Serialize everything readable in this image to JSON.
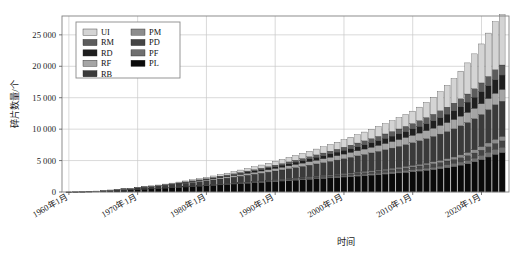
{
  "chart_data": {
    "type": "bar",
    "stacked": true,
    "title": "",
    "xlabel": "时间",
    "ylabel": "碎片数量/个",
    "ylim": [
      0,
      28000
    ],
    "yticks": [
      0,
      5000,
      10000,
      15000,
      20000,
      25000
    ],
    "ytick_labels": [
      "0",
      "5 000",
      "10 000",
      "15 000",
      "20 000",
      "25 000"
    ],
    "grid": true,
    "legend_position": "upper-left",
    "xtick_labels": [
      "1960年1月",
      "1970年1月",
      "1980年1月",
      "1990年1月",
      "2000年1月",
      "2010年1月",
      "2020年1月"
    ],
    "xtick_values": [
      1960,
      1970,
      1980,
      1990,
      2000,
      2010,
      2020
    ],
    "xlim": [
      1959,
      2024
    ],
    "categories": [
      1960,
      1961,
      1962,
      1963,
      1964,
      1965,
      1966,
      1967,
      1968,
      1969,
      1970,
      1971,
      1972,
      1973,
      1974,
      1975,
      1976,
      1977,
      1978,
      1979,
      1980,
      1981,
      1982,
      1983,
      1984,
      1985,
      1986,
      1987,
      1988,
      1989,
      1990,
      1991,
      1992,
      1993,
      1994,
      1995,
      1996,
      1997,
      1998,
      1999,
      2000,
      2001,
      2002,
      2003,
      2004,
      2005,
      2006,
      2007,
      2008,
      2009,
      2010,
      2011,
      2012,
      2013,
      2014,
      2015,
      2016,
      2017,
      2018,
      2019,
      2020,
      2021,
      2022,
      2023
    ],
    "series": [
      {
        "name": "PL",
        "color": "#0a0a0a",
        "values": [
          5,
          18,
          35,
          60,
          95,
          150,
          210,
          265,
          320,
          375,
          430,
          490,
          545,
          600,
          660,
          715,
          770,
          830,
          890,
          950,
          1010,
          1075,
          1140,
          1205,
          1270,
          1335,
          1400,
          1465,
          1530,
          1600,
          1670,
          1740,
          1810,
          1880,
          1950,
          2020,
          2090,
          2160,
          2230,
          2300,
          2375,
          2450,
          2525,
          2600,
          2680,
          2760,
          2845,
          2930,
          3020,
          3110,
          3210,
          3320,
          3440,
          3570,
          3710,
          3870,
          4050,
          4260,
          4500,
          4790,
          5140,
          5560,
          5980,
          6280
        ]
      },
      {
        "name": "PF",
        "color": "#6f6f6f",
        "values": [
          0,
          0,
          0,
          0,
          0,
          0,
          2,
          4,
          6,
          8,
          10,
          12,
          15,
          18,
          20,
          24,
          28,
          32,
          36,
          40,
          45,
          50,
          55,
          60,
          66,
          72,
          78,
          84,
          90,
          96,
          102,
          108,
          115,
          122,
          130,
          138,
          146,
          154,
          162,
          170,
          180,
          190,
          200,
          212,
          224,
          238,
          252,
          268,
          284,
          302,
          322,
          344,
          368,
          394,
          422,
          452,
          486,
          524,
          566,
          612,
          664,
          720,
          778,
          820
        ]
      },
      {
        "name": "PD",
        "color": "#454545",
        "values": [
          0,
          0,
          0,
          0,
          0,
          0,
          0,
          0,
          0,
          0,
          2,
          4,
          6,
          9,
          12,
          15,
          19,
          23,
          28,
          33,
          38,
          44,
          50,
          57,
          64,
          72,
          80,
          89,
          98,
          108,
          118,
          129,
          140,
          152,
          164,
          177,
          190,
          204,
          218,
          233,
          248,
          264,
          280,
          298,
          316,
          336,
          356,
          378,
          400,
          424,
          450,
          478,
          508,
          540,
          574,
          610,
          650,
          694,
          742,
          794,
          850,
          912,
          976,
          1030
        ]
      },
      {
        "name": "PM",
        "color": "#8c8c8c",
        "values": [
          0,
          0,
          0,
          0,
          0,
          0,
          0,
          0,
          0,
          0,
          0,
          0,
          0,
          0,
          0,
          0,
          0,
          0,
          0,
          0,
          2,
          4,
          6,
          8,
          11,
          14,
          17,
          21,
          25,
          29,
          34,
          39,
          44,
          50,
          56,
          63,
          70,
          78,
          86,
          95,
          104,
          114,
          124,
          135,
          147,
          160,
          174,
          189,
          205,
          222,
          240,
          260,
          282,
          306,
          332,
          360,
          392,
          428,
          468,
          512,
          562,
          616,
          672,
          712
        ]
      },
      {
        "name": "RB",
        "color": "#3a3a3a",
        "values": [
          2,
          8,
          18,
          30,
          48,
          70,
          95,
          120,
          150,
          180,
          215,
          250,
          290,
          330,
          375,
          420,
          470,
          520,
          575,
          630,
          690,
          750,
          815,
          880,
          950,
          1020,
          1095,
          1170,
          1250,
          1330,
          1415,
          1500,
          1590,
          1680,
          1775,
          1870,
          1970,
          2070,
          2175,
          2280,
          2390,
          2500,
          2615,
          2730,
          2850,
          2970,
          3095,
          3220,
          3350,
          3480,
          3615,
          3750,
          3890,
          4030,
          4175,
          4320,
          4470,
          4625,
          4785,
          4950,
          5120,
          5295,
          5475,
          5600
        ]
      },
      {
        "name": "RF",
        "color": "#a5a5a5",
        "values": [
          0,
          0,
          0,
          0,
          2,
          5,
          9,
          14,
          20,
          27,
          35,
          44,
          54,
          65,
          77,
          90,
          104,
          119,
          135,
          152,
          170,
          189,
          209,
          230,
          252,
          275,
          299,
          324,
          350,
          377,
          405,
          434,
          464,
          495,
          527,
          560,
          594,
          629,
          665,
          702,
          740,
          779,
          819,
          860,
          902,
          945,
          989,
          1034,
          1080,
          1127,
          1175,
          1224,
          1274,
          1325,
          1377,
          1430,
          1484,
          1539,
          1595,
          1652,
          1710,
          1769,
          1829,
          1870
        ]
      },
      {
        "name": "RD",
        "color": "#1f1f1f",
        "values": [
          0,
          0,
          0,
          0,
          0,
          0,
          0,
          0,
          2,
          5,
          9,
          14,
          20,
          27,
          35,
          44,
          54,
          65,
          77,
          90,
          104,
          119,
          135,
          152,
          170,
          189,
          209,
          230,
          252,
          275,
          299,
          324,
          350,
          377,
          405,
          434,
          464,
          495,
          527,
          560,
          594,
          629,
          665,
          702,
          740,
          780,
          822,
          866,
          912,
          960,
          1010,
          1065,
          1125,
          1190,
          1260,
          1340,
          1430,
          1530,
          1640,
          1760,
          1890,
          2030,
          2180,
          2290
        ]
      },
      {
        "name": "RM",
        "color": "#5c5c5c",
        "values": [
          0,
          0,
          0,
          0,
          0,
          0,
          0,
          0,
          0,
          0,
          0,
          2,
          5,
          9,
          14,
          20,
          27,
          35,
          44,
          54,
          65,
          77,
          90,
          104,
          119,
          135,
          152,
          170,
          189,
          209,
          230,
          252,
          275,
          299,
          324,
          350,
          377,
          405,
          434,
          464,
          495,
          527,
          560,
          594,
          629,
          665,
          702,
          740,
          780,
          822,
          866,
          912,
          960,
          1010,
          1062,
          1116,
          1172,
          1230,
          1290,
          1352,
          1416,
          1482,
          1550,
          1600
        ]
      },
      {
        "name": "UI",
        "color": "#d4d4d4",
        "values": [
          0,
          0,
          0,
          0,
          0,
          0,
          0,
          2,
          6,
          12,
          20,
          30,
          42,
          56,
          72,
          90,
          110,
          132,
          156,
          182,
          210,
          240,
          272,
          306,
          342,
          380,
          420,
          462,
          506,
          552,
          600,
          650,
          702,
          756,
          812,
          870,
          930,
          992,
          1056,
          1122,
          1190,
          1260,
          1332,
          1406,
          1482,
          1560,
          1640,
          1722,
          1806,
          1892,
          1980,
          2150,
          2400,
          2700,
          3050,
          3450,
          3900,
          4400,
          4950,
          5550,
          6200,
          6900,
          7640,
          8000
        ]
      }
    ]
  },
  "legend": {
    "entries": [
      {
        "label": "UI"
      },
      {
        "label": "PM"
      },
      {
        "label": "RM"
      },
      {
        "label": "PD"
      },
      {
        "label": "RD"
      },
      {
        "label": "PF"
      },
      {
        "label": "RF"
      },
      {
        "label": "PL"
      },
      {
        "label": "RB"
      }
    ]
  },
  "style": {
    "grid_color": "#c8c8c8",
    "frame_color": "#808080",
    "text_color": "#1a1a1a",
    "background": "#ffffff"
  }
}
